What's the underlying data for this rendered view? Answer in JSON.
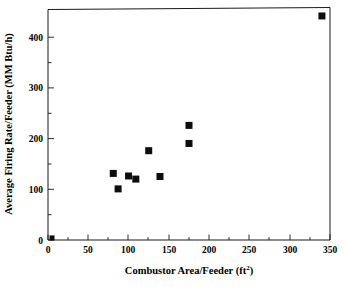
{
  "chart_data": {
    "type": "scatter",
    "title": "",
    "xlabel": "Combustor Area/Feeder (ft2)",
    "xlabel_base": "Combustor Area/Feeder (ft",
    "xlabel_sup": "2",
    "xlabel_tail": ")",
    "ylabel": "Average Firing Rate/Feeder (MM Btu/h)",
    "xlim": [
      0,
      350
    ],
    "ylim": [
      0,
      450
    ],
    "xticks": [
      0,
      50,
      100,
      150,
      200,
      250,
      300,
      350
    ],
    "xtick_labels": [
      "0",
      "50",
      "100",
      "150",
      "200",
      "250",
      "300",
      "350"
    ],
    "yticks": [
      0,
      100,
      200,
      300,
      400
    ],
    "ytick_labels": [
      "0",
      "100",
      "200",
      "300",
      "400"
    ],
    "y_minor_ticks": [
      50,
      150,
      250,
      350
    ],
    "x_minor_ticks": [
      25,
      75,
      125,
      175,
      225,
      275,
      325
    ],
    "grid": false,
    "legend": null,
    "marker_style": "filled-square",
    "marker_color": "#0d0d0d",
    "marker_size_px": 7,
    "points": [
      {
        "x": 5,
        "y": 4
      },
      {
        "x": 81,
        "y": 129
      },
      {
        "x": 87,
        "y": 99
      },
      {
        "x": 100,
        "y": 124
      },
      {
        "x": 109,
        "y": 118
      },
      {
        "x": 125,
        "y": 173
      },
      {
        "x": 139,
        "y": 123
      },
      {
        "x": 175,
        "y": 187
      },
      {
        "x": 175,
        "y": 222
      },
      {
        "x": 340,
        "y": 434
      }
    ],
    "series": [
      {
        "name": "Combustor data",
        "x": [
          5,
          81,
          87,
          100,
          109,
          125,
          139,
          175,
          175,
          340
        ],
        "values": [
          4,
          129,
          99,
          124,
          118,
          173,
          123,
          187,
          222,
          434
        ]
      }
    ]
  },
  "figure": {
    "background_color": "#ffffff",
    "axis_color": "#1a1a1a"
  }
}
